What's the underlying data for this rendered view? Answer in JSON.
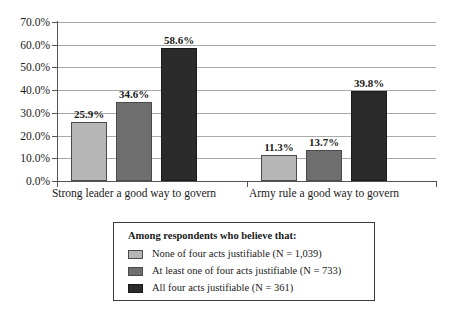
{
  "chart_data": {
    "type": "bar",
    "title": "",
    "xlabel": "",
    "ylabel": "",
    "categories": [
      "Strong leader a good way to govern",
      "Army rule a good way to govern"
    ],
    "series": [
      {
        "name": "None of four acts justifiable (N = 1,039)",
        "color": "#b6b6b6",
        "values": [
          25.9,
          11.3
        ],
        "labels": [
          "25.9%",
          "11.3%"
        ]
      },
      {
        "name": "At least one of four acts justifiable (N = 733)",
        "color": "#6f6f6f",
        "values": [
          34.6,
          13.7
        ],
        "labels": [
          "34.6%",
          "13.7%"
        ]
      },
      {
        "name": "All four acts justifiable (N = 361)",
        "color": "#2b2b2b",
        "values": [
          58.6,
          39.8
        ],
        "labels": [
          "58.6%",
          "39.8%"
        ]
      }
    ],
    "ylim": [
      0,
      70
    ],
    "ytick_values": [
      0,
      10,
      20,
      30,
      40,
      50,
      60,
      70
    ],
    "ytick_labels": [
      "0.0%",
      "10.0%",
      "20.0%",
      "30.0%",
      "40.0%",
      "50.0%",
      "60.0%",
      "70.0%"
    ],
    "grid": true,
    "legend_position": "bottom-center"
  },
  "legend": {
    "title": "Among respondents who believe that:",
    "entries": [
      "None of four acts justifiable (N = 1,039)",
      "At least one of four acts justifiable (N = 733)",
      "All four acts justifiable (N = 361)"
    ]
  }
}
